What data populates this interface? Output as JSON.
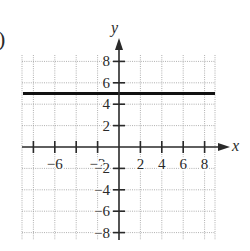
{
  "figure": {
    "part_label": ")",
    "x_axis_label": "x",
    "y_axis_label": "y"
  },
  "chart_data": {
    "type": "line",
    "title": "",
    "xlabel": "x",
    "ylabel": "y",
    "xlim": [
      -9,
      9
    ],
    "ylim": [
      -9,
      9
    ],
    "grid": true,
    "x_ticks": [
      -8,
      -6,
      -4,
      -2,
      2,
      4,
      6,
      8
    ],
    "x_tick_labels": [
      "-6",
      "-2",
      "2",
      "4",
      "6",
      "8"
    ],
    "y_ticks": [
      -8,
      -6,
      -4,
      -2,
      2,
      4,
      6,
      8
    ],
    "y_tick_labels": [
      "8",
      "6",
      "4",
      "2",
      "-2",
      "-4",
      "-6",
      "-8"
    ],
    "series": [
      {
        "name": "y = 5",
        "equation": "y = 5",
        "x": [
          -9,
          9
        ],
        "y": [
          5,
          5
        ]
      }
    ]
  }
}
